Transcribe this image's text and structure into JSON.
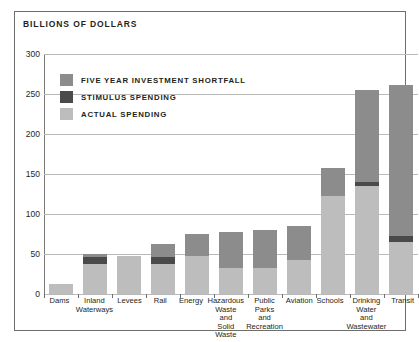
{
  "chart": {
    "title": "BILLIONS OF DOLLARS",
    "frame_color": "#6e6e6e"
  },
  "legend": {
    "position": "top-left",
    "items": [
      {
        "label": "FIVE YEAR INVESTMENT SHORTFALL",
        "color": "#8c8c8c",
        "key": "shortfall"
      },
      {
        "label": "STIMULUS SPENDING",
        "color": "#4a4a4a",
        "key": "stimulus"
      },
      {
        "label": "ACTUAL SPENDING",
        "color": "#bdbdbd",
        "key": "actual"
      }
    ]
  },
  "chart_data": {
    "type": "bar",
    "stacked": true,
    "title": "BILLIONS OF DOLLARS",
    "xlabel": "",
    "ylabel": "BILLIONS OF DOLLARS",
    "ylim": [
      0,
      300
    ],
    "yticks": [
      0,
      50,
      100,
      150,
      200,
      250,
      300
    ],
    "ytick_labels": [
      "0",
      "50",
      "100",
      "150",
      "200",
      "250",
      "300"
    ],
    "grid": true,
    "grid_axis": "y",
    "legend_position": "top-left",
    "categories": [
      "Dams",
      "Inland Waterways",
      "Levees",
      "Rail",
      "Energy",
      "Hazardous Waste and Solid Waste",
      "Public Parks and Recreation",
      "Aviation",
      "Schools",
      "Drinking Water and Wastewater",
      "Transit"
    ],
    "category_labels": [
      [
        "Dams"
      ],
      [
        "Inland",
        "Waterways"
      ],
      [
        "Levees"
      ],
      [
        "Rail"
      ],
      [
        "Energy"
      ],
      [
        "Hazardous",
        "Waste",
        "and",
        "Solid",
        "Waste"
      ],
      [
        "Public",
        "Parks",
        "and",
        "Recreation"
      ],
      [
        "Aviation"
      ],
      [
        "Schools"
      ],
      [
        "Drinking",
        "Water",
        "and",
        "Wastewater"
      ],
      [
        "Transit"
      ]
    ],
    "series": [
      {
        "name": "ACTUAL SPENDING",
        "color": "#bdbdbd",
        "values": [
          12,
          38,
          48,
          38,
          48,
          32,
          33,
          42,
          122,
          135,
          65
        ]
      },
      {
        "name": "STIMULUS SPENDING",
        "color": "#4a4a4a",
        "values": [
          0,
          8,
          0,
          8,
          0,
          0,
          0,
          0,
          0,
          5,
          8
        ]
      },
      {
        "name": "FIVE YEAR INVESTMENT SHORTFALL",
        "color": "#8c8c8c",
        "values": [
          0,
          4,
          0,
          16,
          27,
          45,
          47,
          43,
          35,
          115,
          188
        ]
      }
    ],
    "totals": [
      12,
      50,
      48,
      62,
      75,
      77,
      80,
      85,
      157,
      255,
      261
    ],
    "units": "billions of dollars"
  }
}
